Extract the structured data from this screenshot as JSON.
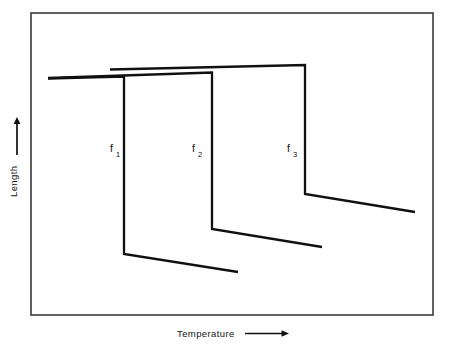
{
  "figure": {
    "background_color": "#ffffff",
    "line_color": "#101010",
    "frame_color": "#3a3a3a"
  },
  "axes": {
    "y_label": "Length",
    "x_label": "Temperature",
    "y_arrow_direction": "up",
    "x_arrow_direction": "right"
  },
  "curve_labels": [
    {
      "base": "f",
      "sub": "1"
    },
    {
      "base": "f",
      "sub": "2"
    },
    {
      "base": "f",
      "sub": "3"
    }
  ],
  "chart_data": {
    "type": "line",
    "title": "",
    "xlabel": "Temperature",
    "ylabel": "Length",
    "grid": false,
    "legend": "none",
    "axis_ticks": "none",
    "xlim": [
      0,
      450
    ],
    "ylim": [
      350,
      0
    ],
    "note": "Three sigmoidal drop curves; y axis inverted in pixel space (smaller y = greater Length)",
    "series": [
      {
        "name": "f1",
        "label": "f",
        "sublabel": "1",
        "points": [
          [
            48,
            78.5
          ],
          [
            124,
            76.5
          ],
          [
            124,
            254
          ],
          [
            238,
            272
          ]
        ],
        "label_pos": [
          110,
          152
        ]
      },
      {
        "name": "f2",
        "label": "f",
        "sublabel": "2",
        "points": [
          [
            48,
            78.0
          ],
          [
            212,
            72.5
          ],
          [
            212,
            229
          ],
          [
            322,
            247
          ]
        ],
        "label_pos": [
          192,
          152
        ]
      },
      {
        "name": "f3",
        "label": "f",
        "sublabel": "3",
        "points": [
          [
            110,
            69.5
          ],
          [
            305,
            65.0
          ],
          [
            305,
            194
          ],
          [
            415,
            212
          ]
        ],
        "label_pos": [
          287,
          152
        ]
      }
    ],
    "frame": {
      "x": 31,
      "y": 13,
      "width": 402,
      "height": 302
    }
  }
}
